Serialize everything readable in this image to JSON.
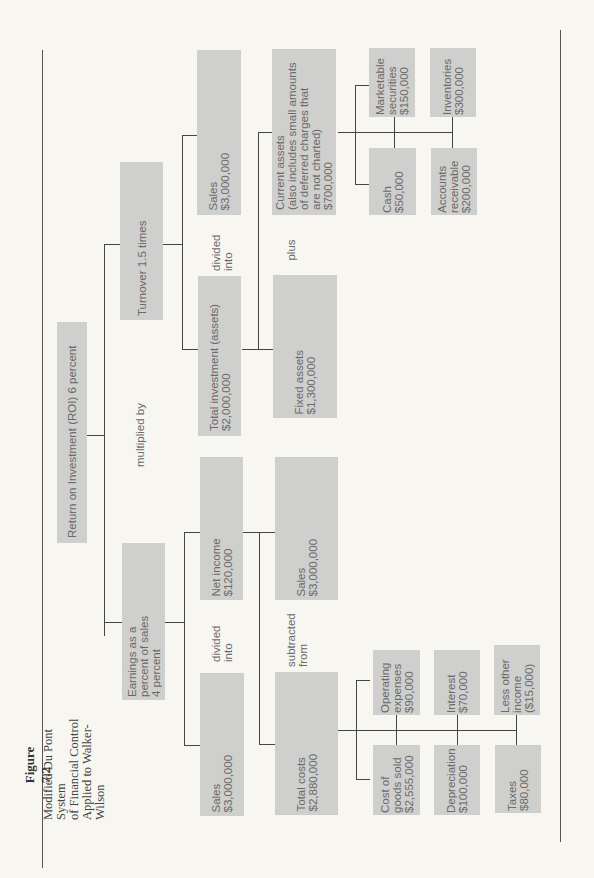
{
  "figure": {
    "number": "Figure 7.2",
    "title_lines": "Modified Du Pont System\nof Financial Control\nApplied to Walker-Wilson"
  },
  "nodes": {
    "roi": "Return on Investment (ROI) 6 percent",
    "turnover": "Turnover 1.5 times",
    "earnings": "Earnings as a\npercent of sales\n4 percent",
    "sales_turnover": "Sales\n$3,000,000",
    "total_investment": "Total investment (assets)\n$2,000,000",
    "net_income": "Net income\n$120,000",
    "sales_earnings": "Sales\n$3,000,000",
    "current_assets": "Current assets\n(also includes small amounts\nof deferred charges that\nare not charted)\n$700,000",
    "fixed_assets": "Fixed assets\n$1,300,000",
    "sales_income": "Sales\n$3,000,000",
    "total_costs": "Total costs\n$2,880,000",
    "marketable_securities": "Marketable\nsecurities\n$150,000",
    "cash": "Cash\n$50,000",
    "inventories": "Inventories\n$300,000",
    "accounts_receivable": "Accounts\nreceivable\n$200,000",
    "operating_expenses": "Operating\nexpenses\n$90,000",
    "cost_of_goods_sold": "Cost of\ngoods sold\n$2,555,000",
    "interest": "Interest\n$70,000",
    "depreciation": "Depreciation\n$100,000",
    "less_other_income": "Less other\nincome\n($15,000)",
    "taxes": "Taxes\n$80,000"
  },
  "operators": {
    "multiplied_by": "multiplied by",
    "divided_into_turnover": "divided\ninto",
    "plus": "plus",
    "divided_into_earnings": "divided\ninto",
    "subtracted_from": "subtracted\nfrom"
  }
}
